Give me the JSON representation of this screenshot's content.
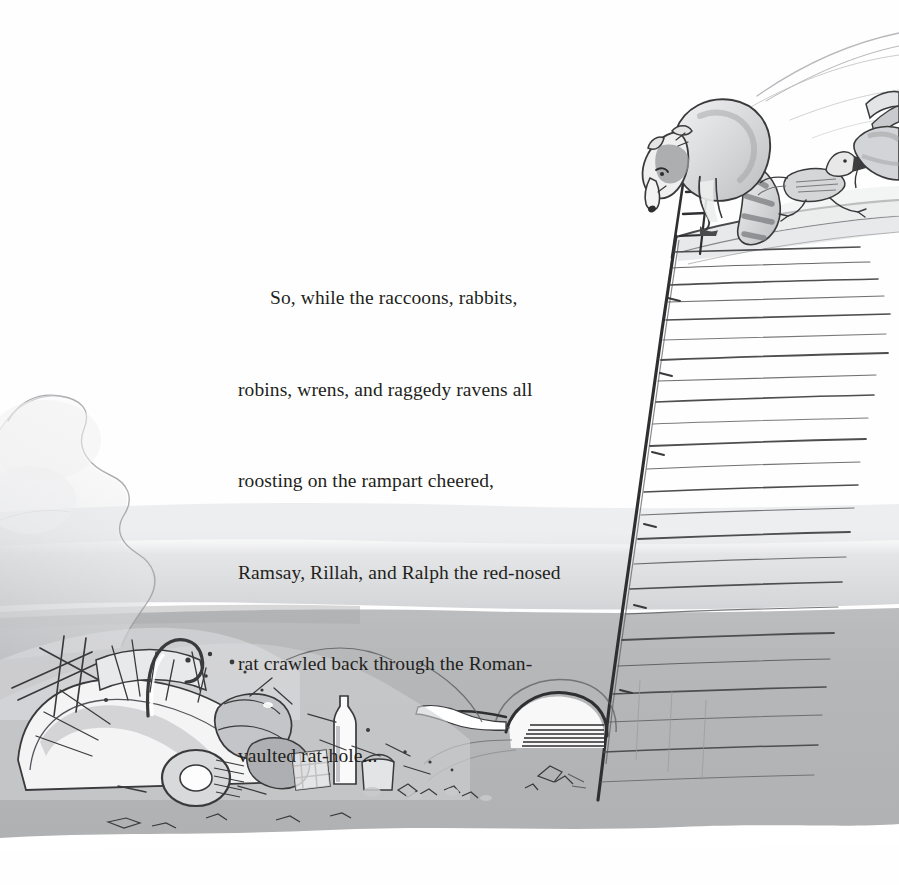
{
  "page": {
    "width": 899,
    "height": 885,
    "background_color": "#fefefe",
    "medium": "pen-and-ink with grey watercolour wash",
    "kind": "picture-book-page"
  },
  "story": {
    "text": "So, while the raccoons, rabbits, robins, wrens, and raggedy ravens all roosting on the rampart cheered, Ramsay, Rillah, and Ralph the red-nosed rat crawled back through the Roman-vaulted rat-hole...",
    "lines": [
      "So, while the raccoons, rabbits,",
      "robins, wrens, and raggedy ravens all",
      "roosting on the rampart cheered,",
      "Ramsay, Rillah, and Ralph the red-nosed",
      "rat crawled back through the Roman-",
      "vaulted rat-hole..."
    ],
    "text_color": "#231f20",
    "first_line_indent_px": 32
  },
  "illustration": {
    "title": "Raccoon on the rampart above the junkyard",
    "palette": {
      "ink": "#3a3a3c",
      "ink_light": "#75757a",
      "wash_pale": "#e9eaec",
      "wash_mid": "#c9cacc",
      "wash_ground": "#b4b5b7",
      "wash_dark": "#9a9b9e",
      "paper": "#fefefe"
    },
    "elements": [
      {
        "name": "rampart-wall",
        "description": "tall slanted brick wall running from top centre-right down to the ground"
      },
      {
        "name": "ladder",
        "description": "ladder leaning against the inside of the rampart"
      },
      {
        "name": "raccoon",
        "description": "raccoon with ringed tail peering down over the wall top"
      },
      {
        "name": "raven",
        "description": "raggedy raven running along the rampart walk"
      },
      {
        "name": "rabbit",
        "description": "partly visible rabbit at the right edge of the rampart"
      },
      {
        "name": "rat-hole",
        "description": "Roman-vaulted arched rat-hole at the base of the wall"
      },
      {
        "name": "junk-pile",
        "description": "wrecked car, tyres, cans, bottles and debris heaped at lower left"
      },
      {
        "name": "smoke-plume",
        "description": "pale smoke curling up from the junk pile"
      },
      {
        "name": "horizon-hills",
        "description": "faint pencil hill lines in the sky at top right"
      },
      {
        "name": "ground-wash",
        "description": "flat grey ground wash across the lower half"
      }
    ]
  }
}
